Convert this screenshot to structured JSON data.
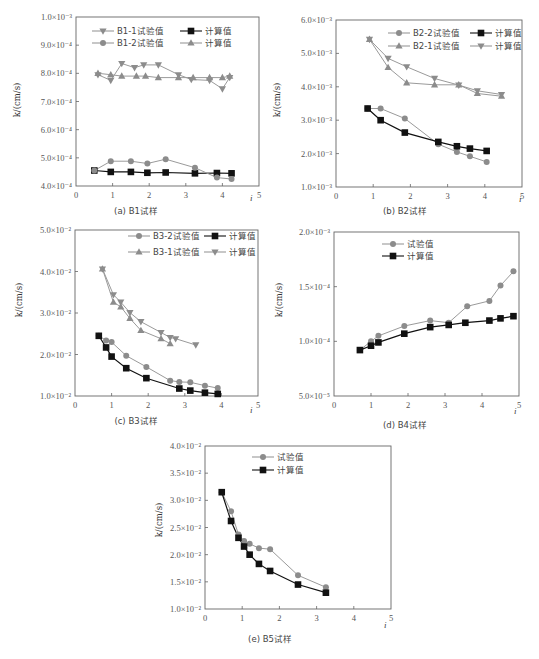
{
  "colors": {
    "gray_series": "#8c8c8c",
    "gray_line": "#9a9a9a",
    "black_series": "#111111",
    "axis": "#666666"
  },
  "chart_data": [
    {
      "id": "a",
      "type": "line",
      "caption": "(a) B1试样",
      "xlabel": "i",
      "ylabel": "k/(cm/s)",
      "xlim": [
        0,
        5
      ],
      "x_ticks": [
        "0",
        "1",
        "2",
        "3",
        "4",
        "5"
      ],
      "ylim": [
        0.0004,
        0.001
      ],
      "y_scale_unit": 0.0001,
      "y_ticks": [
        {
          "v": 4.0,
          "label": "4.0×10⁻⁴"
        },
        {
          "v": 5.0,
          "label": "5.0×10⁻⁴"
        },
        {
          "v": 6.0,
          "label": "6.0×10⁻⁴"
        },
        {
          "v": 7.0,
          "label": "7.0×10⁻⁴"
        },
        {
          "v": 8.0,
          "label": "8.0×10⁻⁴"
        },
        {
          "v": 9.0,
          "label": "9.0×10⁻⁴"
        },
        {
          "v": 10.0,
          "label": "1.0×10⁻³"
        }
      ],
      "grid": false,
      "legend_position": "upper center",
      "legend_columns": 2,
      "series": [
        {
          "name": "B1-1试验值",
          "marker": "triangle-down",
          "color": "gray",
          "x": [
            0.6,
            0.95,
            1.25,
            1.6,
            1.85,
            2.25,
            2.8,
            3.15,
            3.65,
            4.0,
            4.2
          ],
          "y": [
            7.95,
            7.75,
            8.35,
            8.2,
            8.3,
            8.3,
            7.95,
            7.78,
            7.75,
            7.45,
            7.85
          ]
        },
        {
          "name": "计算值",
          "marker": "square",
          "color": "black",
          "x": [
            0.5,
            0.95,
            1.5,
            1.95,
            2.45,
            3.25,
            3.85,
            4.25
          ],
          "y": [
            4.55,
            4.5,
            4.5,
            4.47,
            4.48,
            4.45,
            4.46,
            4.45
          ]
        },
        {
          "name": "B1-2试验值",
          "marker": "circle",
          "color": "gray",
          "x": [
            0.5,
            0.95,
            1.5,
            1.95,
            2.45,
            3.25,
            3.85,
            4.25
          ],
          "y": [
            4.55,
            4.88,
            4.88,
            4.8,
            4.95,
            4.65,
            4.3,
            4.25
          ]
        },
        {
          "name": "计算值",
          "marker": "triangle-up",
          "color": "gray",
          "x": [
            0.6,
            0.95,
            1.25,
            1.65,
            1.9,
            2.25,
            2.8,
            3.2,
            3.65,
            4.0,
            4.2
          ],
          "y": [
            8.0,
            7.95,
            7.9,
            7.9,
            7.9,
            7.85,
            7.85,
            7.85,
            7.85,
            7.85,
            7.9
          ]
        }
      ]
    },
    {
      "id": "b",
      "type": "line",
      "caption": "(b) B2试样",
      "xlabel": "i",
      "ylabel": "k/(cm/s)",
      "xlim": [
        0,
        5
      ],
      "x_ticks": [
        "0",
        "1",
        "2",
        "3",
        "4",
        "5"
      ],
      "ylim": [
        0.001,
        0.006
      ],
      "y_scale_unit": 0.001,
      "y_ticks": [
        {
          "v": 1.0,
          "label": "1.0×10⁻³"
        },
        {
          "v": 2.0,
          "label": "2.0×10⁻³"
        },
        {
          "v": 3.0,
          "label": "3.0×10⁻³"
        },
        {
          "v": 4.0,
          "label": "4.0×10⁻³"
        },
        {
          "v": 5.0,
          "label": "5.0×10⁻³"
        },
        {
          "v": 6.0,
          "label": "6.0×10⁻³"
        }
      ],
      "grid": false,
      "legend_position": "upper right",
      "legend_columns": 2,
      "series": [
        {
          "name": "B2-2试验值",
          "marker": "circle",
          "color": "gray",
          "x": [
            0.85,
            1.2,
            1.85,
            2.75,
            3.25,
            3.6,
            4.05
          ],
          "y": [
            3.35,
            3.35,
            3.05,
            2.28,
            2.05,
            1.92,
            1.75
          ]
        },
        {
          "name": "计算值",
          "marker": "square",
          "color": "black",
          "x": [
            0.85,
            1.2,
            1.85,
            2.75,
            3.25,
            3.6,
            4.05
          ],
          "y": [
            3.35,
            3.0,
            2.63,
            2.35,
            2.22,
            2.15,
            2.08
          ]
        },
        {
          "name": "B2-1试验值",
          "marker": "triangle-up",
          "color": "gray",
          "x": [
            0.9,
            1.4,
            1.9,
            2.65,
            3.3,
            3.8,
            4.45
          ],
          "y": [
            5.42,
            4.58,
            4.12,
            4.06,
            4.06,
            3.8,
            3.72
          ]
        },
        {
          "name": "计算值",
          "marker": "triangle-down",
          "color": "gray",
          "x": [
            0.9,
            1.4,
            1.9,
            2.65,
            3.3,
            3.8,
            4.45
          ],
          "y": [
            5.42,
            4.85,
            4.6,
            4.25,
            4.05,
            3.88,
            3.77
          ]
        }
      ]
    },
    {
      "id": "c",
      "type": "line",
      "caption": "(c) B3试样",
      "xlabel": "i",
      "ylabel": "k/(cm/s)",
      "xlim": [
        0,
        5
      ],
      "x_ticks": [
        "0",
        "1",
        "2",
        "3",
        "4",
        "5"
      ],
      "ylim": [
        0.01,
        0.05
      ],
      "y_scale_unit": 0.01,
      "y_ticks": [
        {
          "v": 1.0,
          "label": "1.0×10⁻²"
        },
        {
          "v": 2.0,
          "label": "2.0×10⁻²"
        },
        {
          "v": 3.0,
          "label": "3.0×10⁻²"
        },
        {
          "v": 4.0,
          "label": "4.0×10⁻²"
        },
        {
          "v": 5.0,
          "label": "5.0×10⁻²"
        }
      ],
      "grid": false,
      "legend_position": "upper right",
      "legend_columns": 2,
      "series": [
        {
          "name": "B3-2试验值",
          "marker": "circle",
          "color": "gray",
          "x": [
            0.65,
            0.85,
            1.0,
            1.4,
            1.95,
            2.6,
            2.85,
            3.15,
            3.55,
            3.9
          ],
          "y": [
            2.45,
            2.34,
            2.3,
            1.97,
            1.7,
            1.37,
            1.34,
            1.33,
            1.25,
            1.19
          ]
        },
        {
          "name": "计算值",
          "marker": "square",
          "color": "black",
          "x": [
            0.65,
            0.85,
            1.0,
            1.4,
            1.95,
            2.85,
            3.15,
            3.55,
            3.9
          ],
          "y": [
            2.45,
            2.17,
            1.95,
            1.67,
            1.43,
            1.18,
            1.13,
            1.08,
            1.05
          ]
        },
        {
          "name": "B3-1试验值",
          "marker": "triangle-up",
          "color": "gray",
          "x": [
            0.75,
            1.05,
            1.25,
            1.5,
            1.8,
            2.35,
            2.6
          ],
          "y": [
            4.06,
            3.26,
            3.15,
            2.87,
            2.58,
            2.38,
            2.26
          ]
        },
        {
          "name": "计算值",
          "marker": "triangle-down",
          "color": "gray",
          "x": [
            0.75,
            1.05,
            1.25,
            1.5,
            1.8,
            2.35,
            2.6,
            2.75,
            3.3
          ],
          "y": [
            4.06,
            3.44,
            3.26,
            3.01,
            2.79,
            2.53,
            2.41,
            2.38,
            2.23
          ]
        }
      ]
    },
    {
      "id": "d",
      "type": "line",
      "caption": "(d) B4试样",
      "xlabel": "i",
      "ylabel": "k/(cm/s)",
      "xlim": [
        0,
        5
      ],
      "x_ticks": [
        "0",
        "1",
        "2",
        "3",
        "4",
        "5"
      ],
      "ylim": [
        5e-05,
        0.0002
      ],
      "y_scale_unit": 0.0001,
      "y_ticks": [
        {
          "v": 0.5,
          "label": "5.0×10⁻⁵"
        },
        {
          "v": 1.0,
          "label": "1.0×10⁻⁴"
        },
        {
          "v": 1.5,
          "label": "1.5×10⁻⁴"
        },
        {
          "v": 2.0,
          "label": "2.0×10⁻³"
        }
      ],
      "grid": false,
      "legend_position": "upper left",
      "legend_columns": 1,
      "series": [
        {
          "name": "试验值",
          "marker": "circle",
          "color": "gray",
          "x": [
            0.7,
            1.0,
            1.2,
            1.9,
            2.6,
            3.1,
            3.6,
            4.2,
            4.5,
            4.85
          ],
          "y": [
            0.92,
            1.0,
            1.05,
            1.14,
            1.19,
            1.17,
            1.32,
            1.37,
            1.51,
            1.64
          ]
        },
        {
          "name": "计算值",
          "marker": "square",
          "color": "black",
          "x": [
            0.7,
            1.0,
            1.2,
            1.9,
            2.6,
            3.1,
            3.55,
            4.2,
            4.5,
            4.85
          ],
          "y": [
            0.92,
            0.96,
            0.99,
            1.07,
            1.13,
            1.15,
            1.17,
            1.19,
            1.21,
            1.23
          ]
        }
      ]
    },
    {
      "id": "e",
      "type": "line",
      "caption": "(e) B5试样",
      "xlabel": "i",
      "ylabel": "k/(cm/s)",
      "xlim": [
        0,
        5
      ],
      "x_ticks": [
        "0",
        "1",
        "2",
        "3",
        "4",
        "5"
      ],
      "ylim": [
        0.01,
        0.04
      ],
      "y_scale_unit": 0.01,
      "y_ticks": [
        {
          "v": 1.0,
          "label": "1.0×10⁻²"
        },
        {
          "v": 1.5,
          "label": "1.5×10⁻²"
        },
        {
          "v": 2.0,
          "label": "2.0×10⁻²"
        },
        {
          "v": 2.5,
          "label": "2.5×10⁻²"
        },
        {
          "v": 3.0,
          "label": "3.0×10⁻²"
        },
        {
          "v": 3.5,
          "label": "3.5×10⁻²"
        },
        {
          "v": 4.0,
          "label": "4.0×10⁻²"
        }
      ],
      "grid": false,
      "legend_position": "upper center",
      "legend_columns": 1,
      "series": [
        {
          "name": "试验值",
          "marker": "circle",
          "color": "gray",
          "x": [
            0.45,
            0.7,
            0.9,
            1.05,
            1.2,
            1.45,
            1.75,
            2.5,
            3.25
          ],
          "y": [
            3.15,
            2.8,
            2.37,
            2.25,
            2.2,
            2.12,
            2.1,
            1.62,
            1.4
          ]
        },
        {
          "name": "计算值",
          "marker": "square",
          "color": "black",
          "x": [
            0.45,
            0.7,
            0.9,
            1.05,
            1.2,
            1.45,
            1.75,
            2.5,
            3.25
          ],
          "y": [
            3.15,
            2.62,
            2.31,
            2.15,
            2.0,
            1.83,
            1.7,
            1.45,
            1.3
          ]
        }
      ]
    }
  ]
}
